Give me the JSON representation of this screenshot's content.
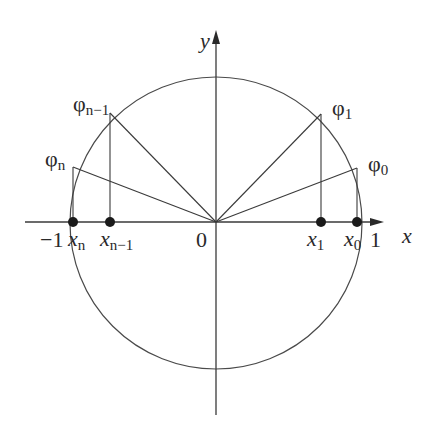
{
  "diagram": {
    "type": "unit-circle-chebyshev-nodes",
    "axes": {
      "x_label": "x",
      "y_label": "y",
      "origin_label": "0",
      "left_tick_label": "−1",
      "right_tick_label": "1"
    },
    "angle_points": [
      {
        "id": "phi_n_minus_1",
        "symbol": "φ",
        "subscript": "n−1"
      },
      {
        "id": "phi_1",
        "symbol": "φ",
        "subscript": "1"
      },
      {
        "id": "phi_n",
        "symbol": "φ",
        "subscript": "n"
      },
      {
        "id": "phi_0",
        "symbol": "φ",
        "subscript": "0"
      }
    ],
    "x_points": [
      {
        "id": "x_n",
        "symbol": "x",
        "subscript": "n"
      },
      {
        "id": "x_n_minus_1",
        "symbol": "x",
        "subscript": "n−1"
      },
      {
        "id": "x_1",
        "symbol": "x",
        "subscript": "1"
      },
      {
        "id": "x_0",
        "symbol": "x",
        "subscript": "0"
      }
    ],
    "colors": {
      "stroke": "#3a3a3a",
      "dot": "#1a1a1a",
      "text": "#2a2a2a",
      "background": "#ffffff"
    }
  }
}
